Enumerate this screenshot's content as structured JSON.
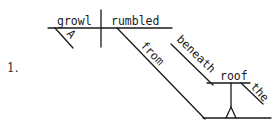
{
  "item_number": "1.",
  "diagram": {
    "type": "Reed-Kellogg sentence diagram",
    "sentence_words": {
      "subject": "growl",
      "subject_modifier": "A",
      "verb": "rumbled",
      "preposition_1": "from",
      "preposition_2": "beneath",
      "object_noun": "roof",
      "object_modifier": "the"
    }
  }
}
